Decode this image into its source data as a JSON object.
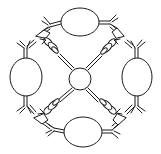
{
  "diagram": {
    "type": "schematic-line-drawing",
    "colors": {
      "line": "#1a1a1a",
      "background": "#ffffff"
    },
    "center_node": {
      "cx": 80,
      "cy": 79,
      "r": 11
    },
    "ovals": [
      {
        "id": "top",
        "cx": 80,
        "cy": 22,
        "rx": 19,
        "ry": 14
      },
      {
        "id": "left",
        "cx": 26,
        "cy": 77,
        "rx": 16,
        "ry": 19
      },
      {
        "id": "right",
        "cx": 137,
        "cy": 77,
        "rx": 15,
        "ry": 19
      },
      {
        "id": "bottom",
        "cx": 83,
        "cy": 132,
        "rx": 19,
        "ry": 15
      }
    ],
    "clamps": [
      {
        "id": "top-left"
      },
      {
        "id": "top-right"
      },
      {
        "id": "bottom-left"
      },
      {
        "id": "bottom-right"
      }
    ],
    "labels": []
  }
}
